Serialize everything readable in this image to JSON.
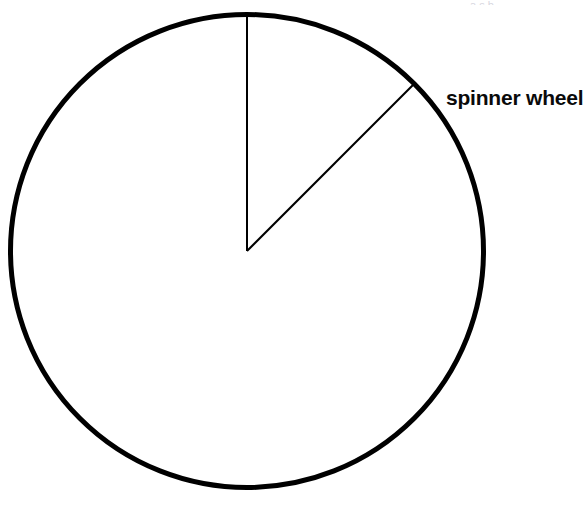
{
  "figure": {
    "title": "",
    "label": "spinner wheel",
    "background_color": "#ffffff",
    "stroke_color": "#000000",
    "top_sliver_text": "a    s   b"
  },
  "chart_data": {
    "type": "pie",
    "title": "",
    "subtitle": "",
    "xlabel": "",
    "ylabel": "",
    "grid": false,
    "legend_position": "right",
    "filled": false,
    "center_x": 247,
    "center_y": 251,
    "radius": 239,
    "outline_stroke_width": 5,
    "radius_stroke_width": 2,
    "start_angle_deg": 0,
    "categories": [
      "sector",
      "remainder"
    ],
    "values": [
      45,
      315
    ],
    "value_unit": "degrees",
    "fractions": [
      0.125,
      0.875
    ],
    "annotations": [
      {
        "text": "spinner wheel",
        "x": 446,
        "y": 97,
        "anchor": "start"
      }
    ],
    "radii_lines": [
      {
        "angle_from_vertical_deg": 0,
        "end_x": 247,
        "end_y": 12
      },
      {
        "angle_from_vertical_deg": 45,
        "end_x": 408,
        "end_y": 92
      }
    ]
  }
}
